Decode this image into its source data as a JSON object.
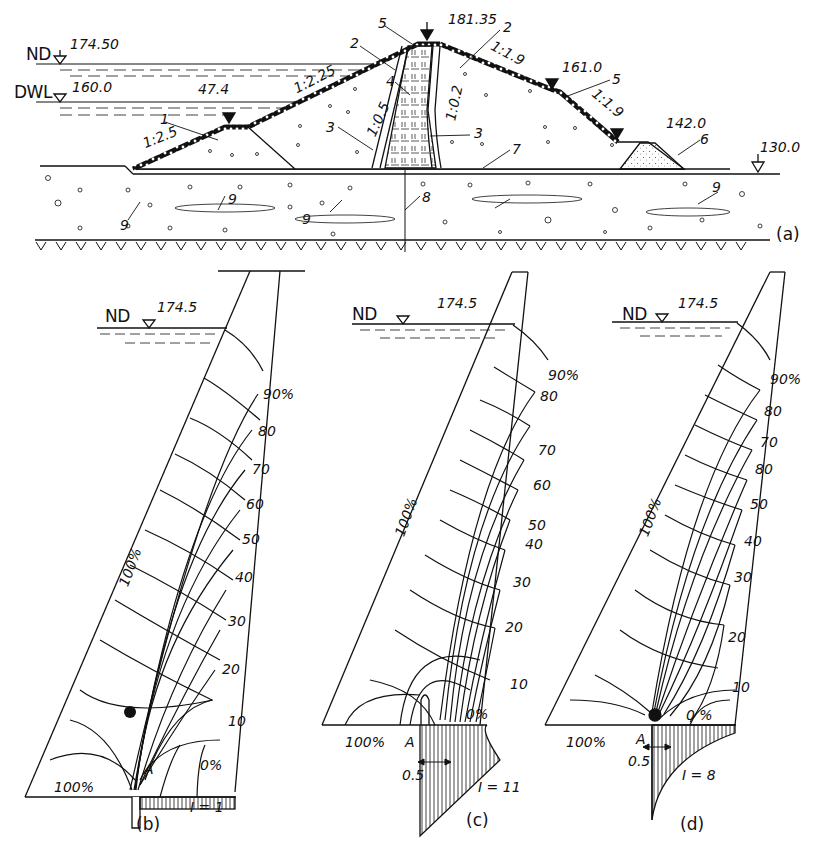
{
  "figure_a": {
    "caption": "(a)",
    "water_levels": [
      {
        "name": "ND",
        "elevation": "174.50"
      },
      {
        "name": "DWL",
        "elevation": "160.0"
      }
    ],
    "elevations": {
      "crest": "181.35",
      "upstream_berm": "47.4",
      "downstream_berm": "161.0",
      "toe_drain": "142.0",
      "ground": "130.0"
    },
    "slopes": {
      "upstream_lower": "1:2.5",
      "upstream_upper": "1:2.25",
      "core_upstream": "1:0.5",
      "core_downstream": "1:0.2",
      "downstream_upper": "1:1.9",
      "downstream_lower": "1:1.9"
    },
    "component_labels": [
      "1",
      "2",
      "3",
      "3",
      "4",
      "5",
      "2",
      "5",
      "6",
      "7",
      "8",
      "9",
      "9",
      "9",
      "9"
    ]
  },
  "flow_nets": [
    {
      "caption": "(b)",
      "water_level": {
        "name": "ND",
        "elevation": "174.5"
      },
      "upstream_label": "100%",
      "bottom_left_label": "100%",
      "point_label": "A",
      "zero_label": "0%",
      "scale_labels": [
        "90%",
        "80",
        "70",
        "60",
        "50",
        "40",
        "30",
        "20",
        "10"
      ],
      "gradient_label": "I = 1"
    },
    {
      "caption": "(c)",
      "water_level": {
        "name": "ND",
        "elevation": "174.5"
      },
      "upstream_label": "100%",
      "bottom_left_label": "100%",
      "point_label": "A",
      "zero_label": "0%",
      "dimension_label": "0.5",
      "scale_labels": [
        "90%",
        "80",
        "70",
        "60",
        "50",
        "40",
        "30",
        "20",
        "10"
      ],
      "gradient_label": "I = 11"
    },
    {
      "caption": "(d)",
      "water_level": {
        "name": "ND",
        "elevation": "174.5"
      },
      "upstream_label": "100%",
      "bottom_left_label": "100%",
      "point_label": "A",
      "zero_label": "0 %",
      "dimension_label": "0.5",
      "scale_labels": [
        "90%",
        "80",
        "70",
        "80",
        "50",
        "40",
        "30",
        "20",
        "10"
      ],
      "gradient_label": "I = 8"
    }
  ]
}
